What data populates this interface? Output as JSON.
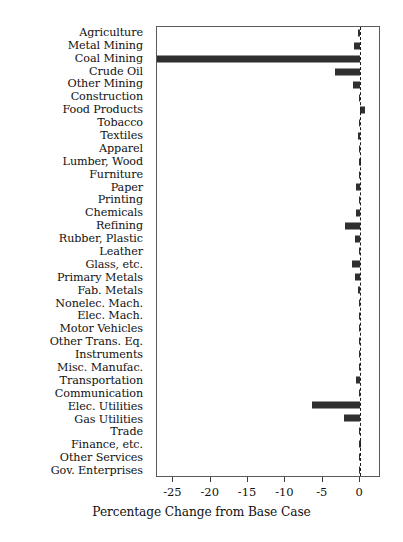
{
  "chart_data": {
    "type": "bar",
    "orientation": "horizontal",
    "title": "",
    "xlabel": "Percentage Change from Base Case",
    "ylabel": "",
    "xlim": [
      -27.2,
      2.8
    ],
    "xticks": [
      -25,
      -20,
      -15,
      -10,
      -5,
      0
    ],
    "xticklabels": [
      "-25",
      "-20",
      "-15",
      "-10",
      "-5",
      "0"
    ],
    "grid": false,
    "legend": null,
    "zero_reference_line": true,
    "bar_color": "#2f2f2f",
    "categories": [
      "Agriculture",
      "Metal Mining",
      "Coal Mining",
      "Crude Oil",
      "Other Mining",
      "Construction",
      "Food Products",
      "Tobacco",
      "Textiles",
      "Apparel",
      "Lumber, Wood",
      "Furniture",
      "Paper",
      "Printing",
      "Chemicals",
      "Refining",
      "Rubber, Plastic",
      "Leather",
      "Glass, etc.",
      "Primary Metals",
      "Fab. Metals",
      "Nonelec. Mach.",
      "Elec. Mach.",
      "Motor Vehicles",
      "Other Trans. Eq.",
      "Instruments",
      "Misc. Manufac.",
      "Transportation",
      "Communication",
      "Elec. Utilities",
      "Gas Utilities",
      "Trade",
      "Finance, etc.",
      "Other Services",
      "Gov. Enterprises"
    ],
    "values": [
      -0.3,
      -0.8,
      -27.2,
      -3.3,
      -0.9,
      -0.2,
      0.6,
      -0.2,
      -0.3,
      -0.2,
      -0.1,
      -0.2,
      -0.5,
      -0.2,
      -0.6,
      -2.0,
      -0.7,
      -0.2,
      -1.1,
      -0.7,
      -0.3,
      -0.2,
      -0.2,
      -0.2,
      -0.2,
      -0.2,
      -0.2,
      -0.5,
      -0.2,
      -6.5,
      -2.2,
      -0.2,
      -0.1,
      -0.2,
      -0.2
    ]
  }
}
